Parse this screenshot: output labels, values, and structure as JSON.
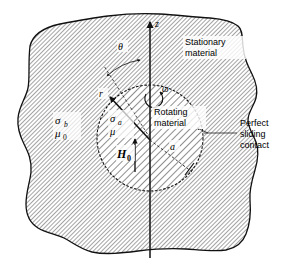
{
  "figure": {
    "background": "#ffffff",
    "ink": "#1a1a1a"
  },
  "regions": {
    "outer": {
      "name": "stationary-material",
      "label_line1": "Stationary",
      "label_line2": "material",
      "conductivity_symbol": "σ",
      "conductivity_subscript": "b",
      "permeability_symbol": "μ",
      "permeability_subscript": "0",
      "hatch_angle_deg": 45,
      "hatch_spacing_px": 3.0,
      "hatch_color": "#4a4a4a"
    },
    "inner": {
      "name": "rotating-material",
      "label_line1": "Rotating",
      "label_line2": "material",
      "conductivity_symbol": "σ",
      "conductivity_subscript": "a",
      "permeability_symbol": "μ",
      "permeability_subscript": "",
      "hatch_angle_deg": 45,
      "hatch_spacing_px": 5.0,
      "hatch_color": "#3a3a3a",
      "center_x": 150,
      "center_y": 138,
      "radius_px": 53
    }
  },
  "annotations": {
    "interface_label_line1": "Perfect",
    "interface_label_line2": "sliding",
    "interface_label_line3": "contact",
    "axis_z": "z",
    "angle_theta": "θ",
    "radius_r": "r",
    "angular_velocity": "ω",
    "radius_a": "a",
    "field_symbol": "H",
    "field_subscript": "0"
  },
  "geometry": {
    "z_axis_top_y": 18,
    "z_axis_bottom_y": 258,
    "z_axis_x": 150,
    "theta_arc_radius": 62,
    "r_arrow_angle_deg": 140,
    "a_dash_angle_deg": -38
  }
}
